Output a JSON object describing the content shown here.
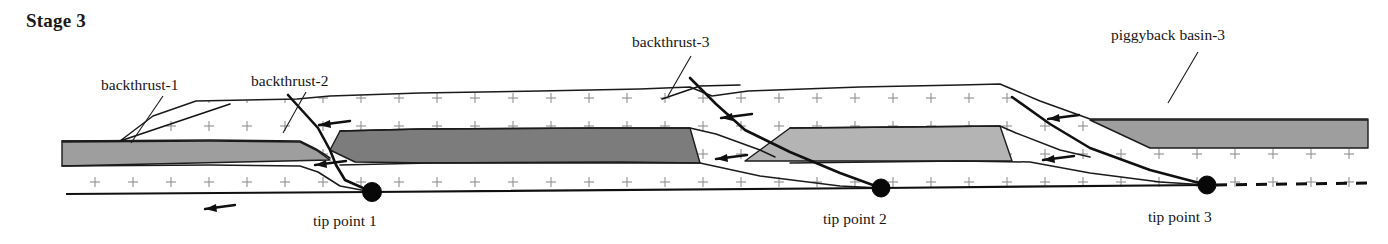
{
  "figure": {
    "title": "Stage 3",
    "title_pos": {
      "x": 26,
      "y": 27
    },
    "width": 1388,
    "height": 244,
    "background_color": "#ffffff",
    "type": "geologic-cross-section"
  },
  "colors": {
    "ink": "#1a1a1a",
    "gray_dark": "#7c7c7c",
    "gray_medium": "#9e9e9e",
    "gray_light": "#b4b4b4",
    "hatch": "#8f8f8f",
    "paper": "#ffffff"
  },
  "hatch": {
    "symbol": "plus-mark",
    "spacing_x": 38,
    "spacing_y": 28,
    "arm": 5,
    "stroke_width": 1.1,
    "color": "#8f8f8f"
  },
  "annotations": [
    {
      "name": "backthrust-1",
      "label": "backthrust-1",
      "text_pos": {
        "x": 101,
        "y": 90
      },
      "leader": "M 163,96 L 131,143"
    },
    {
      "name": "backthrust-2",
      "label": "backthrust-2",
      "text_pos": {
        "x": 251,
        "y": 86
      },
      "leader": "M 306,92 L 283,133"
    },
    {
      "name": "backthrust-3",
      "label": "backthrust-3",
      "text_pos": {
        "x": 632,
        "y": 47
      },
      "leader": "M 691,56 L 668,96"
    },
    {
      "name": "piggyback-basin-3",
      "label": "piggyback basin-3",
      "text_pos": {
        "x": 1111,
        "y": 40
      },
      "leader": "M 1198,52 L 1168,103"
    }
  ],
  "tip_points": [
    {
      "name": "tip-point-1",
      "label": "tip point 1",
      "x": 372,
      "y": 192,
      "r": 9.5,
      "label_pos": {
        "x": 313,
        "y": 226
      }
    },
    {
      "name": "tip-point-2",
      "label": "tip point 2",
      "x": 881,
      "y": 188,
      "r": 9.0,
      "label_pos": {
        "x": 823,
        "y": 224
      }
    },
    {
      "name": "tip-point-3",
      "label": "tip point 3",
      "x": 1207,
      "y": 185,
      "r": 9.0,
      "label_pos": {
        "x": 1148,
        "y": 222
      }
    }
  ],
  "surfaces": [
    {
      "name": "topographic-surface",
      "path": "M 62,141 L 120,141 L 153,116 L 196,101 L 297,99 L 330,96 L 420,93 L 540,91 L 640,89 L 690,87 L 712,96 L 748,91 L 860,87 L 960,85 L 1000,84 L 1040,101 L 1090,119 L 1368,119"
    },
    {
      "name": "intra-horizon-left",
      "path": "M 62,141 L 210,140 L 300,141 L 316,149 L 330,158"
    },
    {
      "name": "intra-horizon-mid",
      "path": "M 340,131 L 420,129 L 600,128 L 690,128 L 716,134 L 760,150 L 775,157"
    },
    {
      "name": "intra-horizon-right",
      "path": "M 790,128 L 900,127 L 1000,126 L 1016,133 L 1060,150 L 1090,157"
    },
    {
      "name": "base-horizon-left",
      "path": "M 62,166 L 210,165 L 300,166 L 318,172 L 340,186 L 372,192"
    },
    {
      "name": "base-horizon-mid",
      "path": "M 340,165 L 430,163 L 620,162 L 700,163 L 760,176 L 840,186 L 881,188"
    },
    {
      "name": "base-horizon-right",
      "path": "M 790,163 L 960,161 L 1030,162 L 1090,173 L 1160,182 L 1207,185"
    }
  ],
  "units": [
    {
      "name": "gray-unit-1",
      "fill": "#9e9e9e",
      "path": "M 62,142 L 210,141 L 300,142 L 316,150 L 330,160 L 62,166 Z"
    },
    {
      "name": "gray-unit-2",
      "fill": "#7c7c7c",
      "path": "M 340,131 L 420,129 L 600,128 L 690,128 L 700,163 L 430,163 L 355,162 L 330,150 Z"
    },
    {
      "name": "gray-unit-3",
      "fill": "#b4b4b4",
      "path": "M 790,128 L 900,127 L 1000,126 L 1012,161 L 880,161 L 800,161 L 745,161 Z"
    },
    {
      "name": "gray-unit-4-piggyback",
      "fill": "#9e9e9e",
      "path": "M 1090,120 L 1368,120 L 1368,148 L 1150,148 Z"
    }
  ],
  "faults": [
    {
      "name": "backthrust-1",
      "path": "M 120,141 L 230,104",
      "style": "thin"
    },
    {
      "name": "backthrust-2",
      "path": "M 288,95 L 318,128 L 330,150 L 336,165 L 345,180 L 372,192",
      "style": "thick"
    },
    {
      "name": "backthrust-3",
      "path": "M 690,78 L 716,104 L 745,130 L 790,152 L 840,173 L 881,188",
      "style": "thick"
    },
    {
      "name": "frontal-thrust-3",
      "path": "M 1012,97 L 1050,124 L 1090,148 L 1150,170 L 1207,185",
      "style": "thick"
    },
    {
      "name": "backthrust-3-upper-splay",
      "path": "M 662,99 L 700,86 L 740,85",
      "style": "thin"
    }
  ],
  "detachment": {
    "name": "basal-detachment",
    "solid_path": "M 66,194 L 372,192 L 881,188 L 1207,185",
    "dashed_path": "M 1216,185 L 1368,183"
  },
  "sense_arrows": [
    {
      "name": "sense-arrow-1",
      "path": "M 235,205 L 205,209",
      "head": "M 205,209 L 216,204 L 217,212 Z"
    },
    {
      "name": "sense-arrow-2",
      "path": "M 346,161 L 315,165",
      "head": "M 315,165 L 326,160 L 327,168 Z"
    },
    {
      "name": "sense-arrow-3",
      "path": "M 350,121 L 319,125",
      "head": "M 319,125 L 330,120 L 331,128 Z"
    },
    {
      "name": "sense-arrow-4",
      "path": "M 747,155 L 716,159",
      "head": "M 716,159 L 727,154 L 728,162 Z"
    },
    {
      "name": "sense-arrow-5",
      "path": "M 752,114 L 721,118",
      "head": "M 721,118 L 732,113 L 733,121 Z"
    },
    {
      "name": "sense-arrow-6",
      "path": "M 1074,156 L 1043,160",
      "head": "M 1043,160 L 1054,155 L 1055,163 Z"
    },
    {
      "name": "sense-arrow-7",
      "path": "M 1079,115 L 1048,119",
      "head": "M 1048,119 L 1059,114 L 1060,122 Z"
    }
  ]
}
